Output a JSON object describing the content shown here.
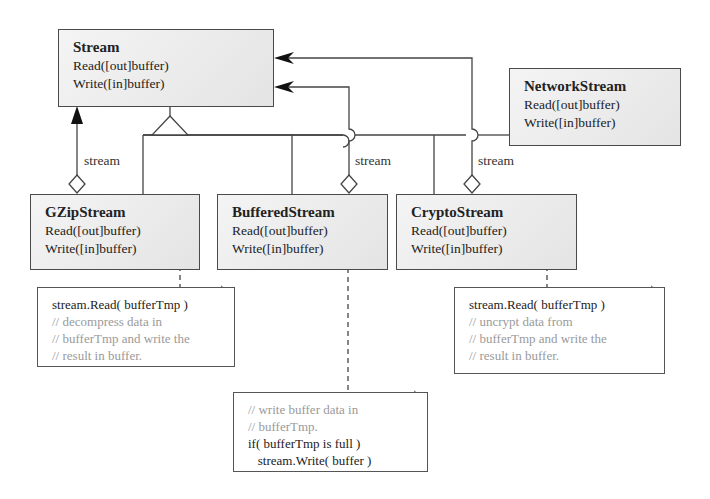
{
  "classes": {
    "stream": {
      "name": "Stream",
      "ops": [
        "Read([out]buffer)",
        "Write([in]buffer)"
      ]
    },
    "network": {
      "name": "NetworkStream",
      "ops": [
        "Read([out]buffer)",
        "Write([in]buffer)"
      ]
    },
    "gzip": {
      "name": "GZipStream",
      "ops": [
        "Read([out]buffer)",
        "Write([in]buffer)"
      ]
    },
    "buffered": {
      "name": "BufferedStream",
      "ops": [
        "Read([out]buffer)",
        "Write([in]buffer)"
      ]
    },
    "crypto": {
      "name": "CryptoStream",
      "ops": [
        "Read([out]buffer)",
        "Write([in]buffer)"
      ]
    }
  },
  "association_labels": [
    "stream",
    "stream",
    "stream"
  ],
  "notes": {
    "gzip": [
      {
        "text": "stream.Read( bufferTmp )",
        "kind": "code"
      },
      {
        "text": "// decompress data in",
        "kind": "comment"
      },
      {
        "text": "// bufferTmp and write the",
        "kind": "comment"
      },
      {
        "text": "// result in buffer.",
        "kind": "comment"
      }
    ],
    "crypto": [
      {
        "text": "stream.Read( bufferTmp )",
        "kind": "code"
      },
      {
        "text": "// uncrypt data from",
        "kind": "comment"
      },
      {
        "text": "// bufferTmp and write the",
        "kind": "comment"
      },
      {
        "text": "// result in buffer.",
        "kind": "comment"
      }
    ],
    "buffered": [
      {
        "text": "// write buffer data in",
        "kind": "comment"
      },
      {
        "text": "// bufferTmp.",
        "kind": "comment"
      },
      {
        "text": "if( bufferTmp is full )",
        "kind": "code"
      },
      {
        "text": "   stream.Write( buffer )",
        "kind": "code"
      }
    ]
  }
}
